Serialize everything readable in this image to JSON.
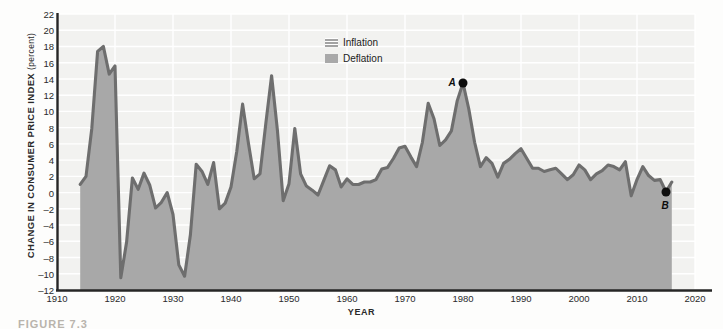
{
  "figure": {
    "caption": "FIGURE 7.3"
  },
  "axes": {
    "ylabel_main": "CHANGE IN CONSUMER PRICE INDEX",
    "ylabel_unit": "(percent)",
    "xlabel": "YEAR"
  },
  "legend": {
    "position": "top-center",
    "items": [
      {
        "label": "Inflation",
        "swatch": "hatched",
        "color": "#a3a3a3"
      },
      {
        "label": "Deflation",
        "swatch": "solid",
        "color": "#a9a9a9"
      }
    ]
  },
  "annotations": [
    {
      "id": "A",
      "label": "A",
      "year": 1980,
      "value": 13.5
    },
    {
      "id": "B",
      "label": "B",
      "year": 2015,
      "value": 0.1
    }
  ],
  "colors": {
    "fill": "#a8a8a8",
    "line": "#6e6e6e",
    "grid": "#ffffff",
    "plot_background": "#f2f2f0",
    "page_background": "#fdfdfc",
    "axis": "#262626",
    "annotation": "#0d0d0d"
  },
  "chart_data": {
    "type": "area",
    "title": "",
    "subtitle": "",
    "xlabel": "YEAR",
    "ylabel": "CHANGE IN CONSUMER PRICE INDEX (percent)",
    "xlim": [
      1910,
      2020
    ],
    "ylim": [
      -12,
      22
    ],
    "xticks": [
      1910,
      1920,
      1930,
      1940,
      1950,
      1960,
      1970,
      1980,
      1990,
      2000,
      2010,
      2020
    ],
    "yticks": [
      22,
      20,
      18,
      16,
      14,
      12,
      10,
      8,
      6,
      4,
      2,
      0,
      -2,
      -4,
      -6,
      -8,
      -10,
      -12
    ],
    "grid": true,
    "legend_position": "top-center",
    "series": [
      {
        "name": "Change in Consumer Price Index",
        "x": [
          1914,
          1915,
          1916,
          1917,
          1918,
          1919,
          1920,
          1921,
          1922,
          1923,
          1924,
          1925,
          1926,
          1927,
          1928,
          1929,
          1930,
          1931,
          1932,
          1933,
          1934,
          1935,
          1936,
          1937,
          1938,
          1939,
          1940,
          1941,
          1942,
          1943,
          1944,
          1945,
          1946,
          1947,
          1948,
          1949,
          1950,
          1951,
          1952,
          1953,
          1954,
          1955,
          1956,
          1957,
          1958,
          1959,
          1960,
          1961,
          1962,
          1963,
          1964,
          1965,
          1966,
          1967,
          1968,
          1969,
          1970,
          1971,
          1972,
          1973,
          1974,
          1975,
          1976,
          1977,
          1978,
          1979,
          1980,
          1981,
          1982,
          1983,
          1984,
          1985,
          1986,
          1987,
          1988,
          1989,
          1990,
          1991,
          1992,
          1993,
          1994,
          1995,
          1996,
          1997,
          1998,
          1999,
          2000,
          2001,
          2002,
          2003,
          2004,
          2005,
          2006,
          2007,
          2008,
          2009,
          2010,
          2011,
          2012,
          2013,
          2014,
          2015,
          2016
        ],
        "values": [
          1.0,
          2.0,
          7.9,
          17.4,
          18.0,
          14.6,
          15.6,
          -10.5,
          -6.1,
          1.8,
          0.4,
          2.4,
          0.9,
          -1.9,
          -1.2,
          0.0,
          -2.7,
          -8.9,
          -10.3,
          -5.2,
          3.5,
          2.6,
          1.0,
          3.7,
          -2.0,
          -1.3,
          0.7,
          5.1,
          10.9,
          6.1,
          1.7,
          2.3,
          8.5,
          14.4,
          7.7,
          -1.0,
          1.1,
          7.9,
          2.3,
          0.8,
          0.3,
          -0.3,
          1.5,
          3.3,
          2.8,
          0.7,
          1.7,
          1.0,
          1.0,
          1.3,
          1.3,
          1.6,
          2.9,
          3.1,
          4.2,
          5.5,
          5.7,
          4.4,
          3.2,
          6.2,
          11.0,
          9.1,
          5.8,
          6.5,
          7.6,
          11.3,
          13.5,
          10.3,
          6.2,
          3.2,
          4.3,
          3.6,
          1.9,
          3.6,
          4.1,
          4.8,
          5.4,
          4.2,
          3.0,
          3.0,
          2.6,
          2.8,
          3.0,
          2.3,
          1.6,
          2.2,
          3.4,
          2.8,
          1.6,
          2.3,
          2.7,
          3.4,
          3.2,
          2.8,
          3.8,
          -0.4,
          1.6,
          3.2,
          2.1,
          1.5,
          1.6,
          0.1,
          1.3
        ]
      }
    ]
  }
}
